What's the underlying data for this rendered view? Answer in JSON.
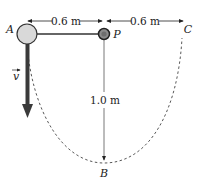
{
  "diagram": {
    "points": {
      "A": "A",
      "P": "P",
      "B": "B",
      "C": "C"
    },
    "dimensions": {
      "left_span": "0.6 m",
      "right_span": "0.6 m",
      "vertical": "1.0 m"
    },
    "velocity_label": "v",
    "colors": {
      "ball_fill": "#d9d9d9",
      "pivot_fill": "#8c8c8c",
      "stroke": "#333333",
      "velocity_arrow": "#3a3a3a",
      "path": "#444444"
    }
  }
}
